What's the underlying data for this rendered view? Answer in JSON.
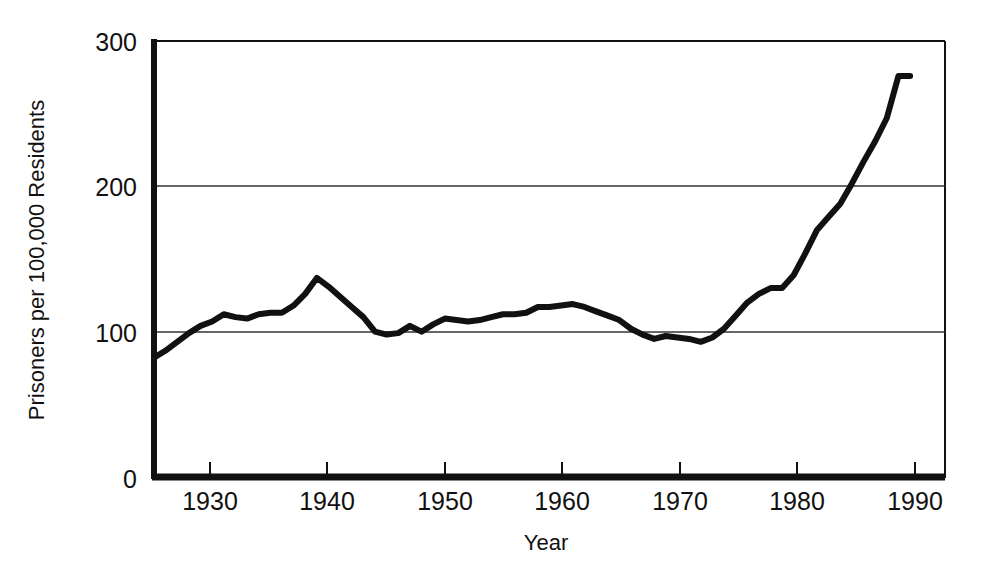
{
  "chart_data": {
    "type": "line",
    "title": "",
    "subtitle": "",
    "xlabel": "Year",
    "ylabel": "Prisoners per 100,000 Residents",
    "xlim": [
      1925,
      1993
    ],
    "ylim": [
      0,
      300
    ],
    "grid": "horizontal-gridlines-at-100-and-200",
    "legend": "none",
    "xticks": [
      1930,
      1940,
      1950,
      1960,
      1970,
      1980,
      1990
    ],
    "xtick_labels": [
      "1930",
      "1940",
      "1950",
      "1960",
      "1970",
      "1980",
      "1990"
    ],
    "yticks": [
      0,
      100,
      200,
      300
    ],
    "ytick_labels": [
      "0",
      "100",
      "200",
      "300"
    ],
    "series": [
      {
        "name": "Incarceration rate",
        "color": "#111111",
        "line_width": 6,
        "x": [
          1925,
          1926,
          1927,
          1928,
          1929,
          1930,
          1931,
          1932,
          1933,
          1934,
          1935,
          1936,
          1937,
          1938,
          1939,
          1940,
          1941,
          1942,
          1943,
          1944,
          1945,
          1946,
          1947,
          1948,
          1949,
          1950,
          1951,
          1952,
          1953,
          1954,
          1955,
          1956,
          1957,
          1958,
          1959,
          1960,
          1961,
          1962,
          1963,
          1964,
          1965,
          1966,
          1967,
          1968,
          1969,
          1970,
          1971,
          1972,
          1973,
          1974,
          1975,
          1976,
          1977,
          1978,
          1979,
          1980,
          1981,
          1982,
          1983,
          1984,
          1985,
          1986,
          1987,
          1988,
          1989,
          1990
        ],
        "y": [
          82,
          87,
          93,
          99,
          104,
          107,
          112,
          110,
          109,
          112,
          113,
          113,
          118,
          126,
          137,
          131,
          124,
          117,
          110,
          100,
          98,
          99,
          104,
          100,
          105,
          109,
          108,
          107,
          108,
          110,
          112,
          112,
          113,
          117,
          117,
          118,
          119,
          117,
          114,
          111,
          108,
          102,
          98,
          95,
          97,
          96,
          95,
          93,
          96,
          102,
          111,
          120,
          126,
          130,
          130,
          139,
          154,
          170,
          179,
          188,
          202,
          217,
          231,
          247,
          276,
          276
        ]
      }
    ],
    "annotations": []
  },
  "axes": {
    "y_axis_title": "Prisoners per 100,000 Residents",
    "x_axis_title": "Year",
    "y_tick_300": "300",
    "y_tick_200": "200",
    "y_tick_100": "100",
    "y_tick_0": "0",
    "x_tick_1930": "1930",
    "x_tick_1940": "1940",
    "x_tick_1950": "1950",
    "x_tick_1960": "1960",
    "x_tick_1970": "1970",
    "x_tick_1980": "1980",
    "x_tick_1990": "1990"
  },
  "style": {
    "background_color": "#ffffff",
    "line_color": "#111111",
    "axis_color": "#111111",
    "gridline_color": "#333333"
  }
}
